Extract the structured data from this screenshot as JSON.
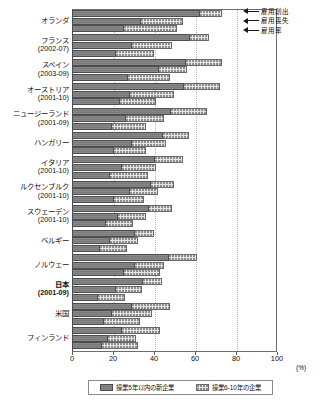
{
  "chart_data": {
    "type": "bar",
    "title": "",
    "xlabel": "(%)",
    "ylabel": "",
    "xlim": [
      0,
      100
    ],
    "xticks": [
      0,
      20,
      40,
      60,
      80,
      100
    ],
    "grid": "vertical-dotted",
    "orientation": "horizontal",
    "grouping": "three-measures-per-country",
    "unit": "(%)",
    "measures": [
      {
        "key": "creation",
        "label": "雇用創出"
      },
      {
        "key": "loss",
        "label": "雇用喪失"
      },
      {
        "key": "rate",
        "label": "雇用率"
      }
    ],
    "stack_series": [
      {
        "key": "new5",
        "label": "操業5年以内の新企業",
        "color": "#7a7a7a",
        "pattern": "solid-dark"
      },
      {
        "key": "y6to10",
        "label": "操業6-10年の企業",
        "color": "#e4e4e4",
        "pattern": "dotted"
      }
    ],
    "categories": [
      {
        "name": "オランダ",
        "period": "",
        "bold": false,
        "creation": {
          "new5": 62,
          "y6to10": 11
        },
        "loss": {
          "new5": 33,
          "y6to10": 21
        },
        "rate": {
          "new5": 25,
          "y6to10": 26
        }
      },
      {
        "name": "フランス",
        "period": "(2002-07)",
        "bold": false,
        "creation": {
          "new5": 57,
          "y6to10": 10
        },
        "loss": {
          "new5": 29,
          "y6to10": 20
        },
        "rate": {
          "new5": 21,
          "y6to10": 19
        }
      },
      {
        "name": "スペイン",
        "period": "(2003-09)",
        "bold": false,
        "creation": {
          "new5": 55,
          "y6to10": 18
        },
        "loss": {
          "new5": 42,
          "y6to10": 14
        },
        "rate": {
          "new5": 27,
          "y6to10": 21
        }
      },
      {
        "name": "オーストリア",
        "period": "(2001-10)",
        "bold": false,
        "creation": {
          "new5": 54,
          "y6to10": 18
        },
        "loss": {
          "new5": 28,
          "y6to10": 22
        },
        "rate": {
          "new5": 23,
          "y6to10": 18
        }
      },
      {
        "name": "ニュージーランド",
        "period": "(2001-09)",
        "bold": false,
        "creation": {
          "new5": 48,
          "y6to10": 18
        },
        "loss": {
          "new5": 26,
          "y6to10": 19
        },
        "rate": {
          "new5": 19,
          "y6to10": 17
        }
      },
      {
        "name": "ハンガリー",
        "period": "",
        "bold": false,
        "creation": {
          "new5": 44,
          "y6to10": 13
        },
        "loss": {
          "new5": 29,
          "y6to10": 17
        },
        "rate": {
          "new5": 20,
          "y6to10": 16
        }
      },
      {
        "name": "イタリア",
        "period": "(2001-10)",
        "bold": false,
        "creation": {
          "new5": 40,
          "y6to10": 14
        },
        "loss": {
          "new5": 24,
          "y6to10": 17
        },
        "rate": {
          "new5": 18,
          "y6to10": 19
        }
      },
      {
        "name": "ルクセンブルク",
        "period": "(2001-10)",
        "bold": false,
        "creation": {
          "new5": 38,
          "y6to10": 12
        },
        "loss": {
          "new5": 28,
          "y6to10": 14
        },
        "rate": {
          "new5": 20,
          "y6to10": 15
        }
      },
      {
        "name": "スウェーデン",
        "period": "(2001-10)",
        "bold": false,
        "creation": {
          "new5": 37,
          "y6to10": 12
        },
        "loss": {
          "new5": 22,
          "y6to10": 14
        },
        "rate": {
          "new5": 16,
          "y6to10": 14
        }
      },
      {
        "name": "ベルギー",
        "period": "",
        "bold": false,
        "creation": {
          "new5": 30,
          "y6to10": 10
        },
        "loss": {
          "new5": 18,
          "y6to10": 14
        },
        "rate": {
          "new5": 13,
          "y6to10": 14
        }
      },
      {
        "name": "ノルウェー",
        "period": "",
        "bold": false,
        "creation": {
          "new5": 47,
          "y6to10": 14
        },
        "loss": {
          "new5": 30,
          "y6to10": 15
        },
        "rate": {
          "new5": 25,
          "y6to10": 18
        }
      },
      {
        "name": "日本",
        "period": "(2001-09)",
        "bold": true,
        "creation": {
          "new5": 34,
          "y6to10": 10
        },
        "loss": {
          "new5": 21,
          "y6to10": 13
        },
        "rate": {
          "new5": 12,
          "y6to10": 14
        }
      },
      {
        "name": "米国",
        "period": "",
        "bold": false,
        "creation": {
          "new5": 29,
          "y6to10": 19
        },
        "loss": {
          "new5": 19,
          "y6to10": 20
        },
        "rate": {
          "new5": 15,
          "y6to10": 18
        }
      },
      {
        "name": "フィンランド",
        "period": "",
        "bold": false,
        "creation": {
          "new5": 24,
          "y6to10": 19
        },
        "loss": {
          "new5": 17,
          "y6to10": 14
        },
        "rate": {
          "new5": 14,
          "y6to10": 18
        }
      }
    ]
  }
}
